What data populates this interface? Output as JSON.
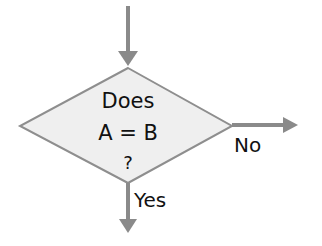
{
  "diagram": {
    "type": "flowchart-decision",
    "colors": {
      "arrow": "#8a8a8a",
      "diamond_fill": "#efefef",
      "diamond_stroke": "#8e8e8e",
      "text": "#111111",
      "background": "#ffffff"
    },
    "decision": {
      "shape": "diamond",
      "lines": [
        "Does",
        "A = B",
        "?"
      ]
    },
    "edges": [
      {
        "id": "incoming",
        "direction": "down",
        "label": ""
      },
      {
        "id": "no-branch",
        "direction": "right",
        "label": "No"
      },
      {
        "id": "yes-branch",
        "direction": "down",
        "label": "Yes"
      }
    ]
  }
}
